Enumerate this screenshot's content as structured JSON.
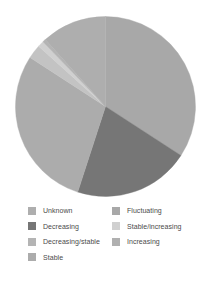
{
  "chart_data": {
    "type": "pie",
    "title": "",
    "categories": [
      "Unknown",
      "Decreasing",
      "Decreasing/stable",
      "Stable",
      "Fluctuating",
      "Stable/increasing",
      "Increasing"
    ],
    "values": [
      11.7,
      20.8,
      2.5,
      29.2,
      34.2,
      1.1,
      0.5
    ],
    "value_unit": "percent",
    "colors": [
      "#aeaeae",
      "#767676",
      "#c3c3c3",
      "#acacac",
      "#a8a8a8",
      "#d0d0d0",
      "#b4b4b4"
    ],
    "start_angle_deg": 0,
    "direction": "clockwise",
    "legend_position": "bottom",
    "legend_columns": 2,
    "grid": false,
    "xlabel": "",
    "ylabel": "",
    "slices": [
      {
        "label": "Fluctuating",
        "value": 34.2,
        "color": "#a8a8a8",
        "start_deg": 0.0,
        "end_deg": 123.0
      },
      {
        "label": "Decreasing",
        "value": 20.8,
        "color": "#767676",
        "start_deg": 123.0,
        "end_deg": 198.0
      },
      {
        "label": "Stable",
        "value": 29.2,
        "color": "#acacac",
        "start_deg": 198.0,
        "end_deg": 303.0
      },
      {
        "label": "Decreasing/stable",
        "value": 2.5,
        "color": "#c3c3c3",
        "start_deg": 303.0,
        "end_deg": 312.0
      },
      {
        "label": "Stable/increasing",
        "value": 1.1,
        "color": "#d0d0d0",
        "start_deg": 312.0,
        "end_deg": 316.0
      },
      {
        "label": "Increasing",
        "value": 0.5,
        "color": "#b4b4b4",
        "start_deg": 316.0,
        "end_deg": 318.0
      },
      {
        "label": "Unknown",
        "value": 11.7,
        "color": "#aeaeae",
        "start_deg": 318.0,
        "end_deg": 360.0
      }
    ]
  },
  "legend": {
    "left_column": [
      {
        "label": "Unknown",
        "color": "#aeaeae"
      },
      {
        "label": "Decreasing",
        "color": "#767676"
      },
      {
        "label": "Decreasing/stable",
        "color": "#b4b4b4"
      },
      {
        "label": "Stable",
        "color": "#acacac"
      }
    ],
    "right_column": [
      {
        "label": "Fluctuating",
        "color": "#a8a8a8"
      },
      {
        "label": "Stable/increasing",
        "color": "#d0d0d0"
      },
      {
        "label": "Increasing",
        "color": "#b0b0b0"
      }
    ]
  }
}
